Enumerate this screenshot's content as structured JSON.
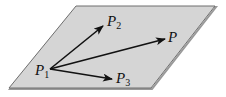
{
  "diagram": {
    "type": "plane-with-vectors",
    "plane": {
      "fill": "#d5d5d5",
      "edge": "#6e6e6e",
      "corners": [
        [
          76,
          6
        ],
        [
          215,
          6
        ],
        [
          151,
          88
        ],
        [
          9,
          88
        ]
      ]
    },
    "origin": {
      "name": "P",
      "subscript": "1",
      "x": 50,
      "y": 69
    },
    "vectors": [
      {
        "to": "P2",
        "label": "P",
        "subscript": "2",
        "end": [
          103,
          26
        ]
      },
      {
        "to": "P",
        "label": "P",
        "subscript": "",
        "end": [
          165,
          39
        ]
      },
      {
        "to": "P3",
        "label": "P",
        "subscript": "3",
        "end": [
          112,
          79
        ]
      }
    ],
    "arrow_color": "#111111"
  }
}
